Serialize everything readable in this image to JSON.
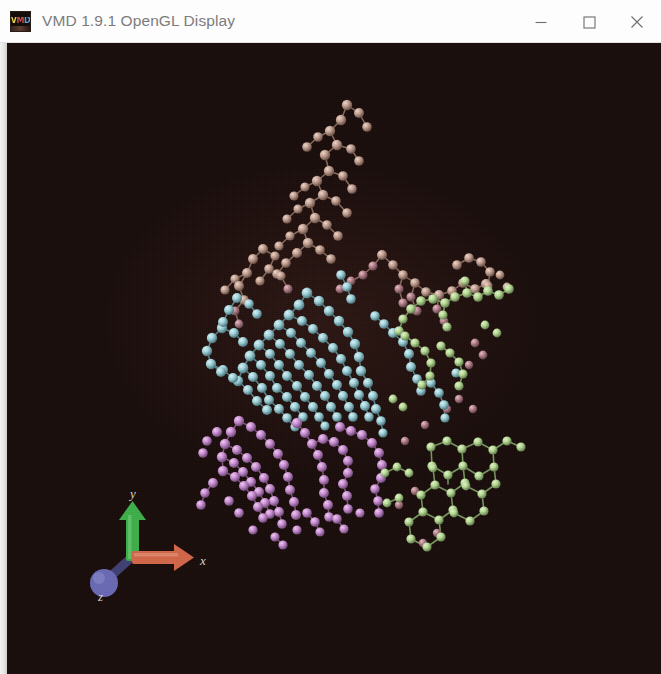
{
  "window": {
    "title": "VMD 1.9.1 OpenGL Display",
    "app_icon_name": "vmd-icon",
    "app_icon_text": "VMD",
    "controls": {
      "minimize_label": "Minimize",
      "maximize_label": "Maximize",
      "close_label": "Close"
    }
  },
  "viewport": {
    "name": "opengl-display-canvas",
    "background_color": "#190d0b",
    "representation": "CPK (ball and stick)",
    "axis_indicator": {
      "x_label": "x",
      "y_label": "y",
      "z_label": "z",
      "x_color": "#d2674a",
      "y_color": "#3fae4a",
      "z_color": "#6a6ab4"
    },
    "molecule_groups": [
      {
        "name": "tan-chain",
        "color": "#c2a192",
        "label": "tan residues"
      },
      {
        "name": "cyan-domain",
        "color": "#9fd2da",
        "label": "cyan residues"
      },
      {
        "name": "violet-domain",
        "color": "#cb8fd4",
        "label": "violet residues"
      },
      {
        "name": "green-rings",
        "color": "#b7db94",
        "label": "green aromatic rings"
      }
    ]
  }
}
